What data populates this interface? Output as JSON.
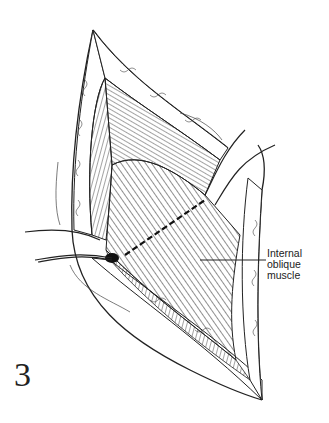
{
  "figure": {
    "number": "3",
    "labels": [
      {
        "lines": [
          "Internal",
          "oblique",
          "muscle"
        ],
        "target": "internal-oblique-muscle"
      }
    ]
  },
  "colors": {
    "ink": "#222222",
    "paper": "#ffffff"
  }
}
